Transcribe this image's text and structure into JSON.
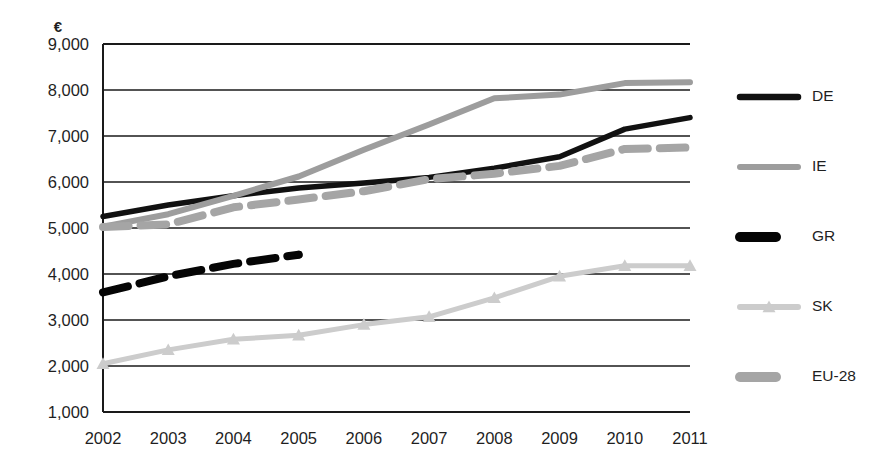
{
  "chart_data": {
    "type": "line",
    "title": "",
    "subtitle": "",
    "xlabel": "",
    "ylabel": "",
    "y_unit_symbol": "€",
    "categories": [
      "2002",
      "2003",
      "2004",
      "2005",
      "2006",
      "2007",
      "2008",
      "2009",
      "2010",
      "2011"
    ],
    "x": [
      2002,
      2003,
      2004,
      2005,
      2006,
      2007,
      2008,
      2009,
      2010,
      2011
    ],
    "xlim": [
      2002,
      2011
    ],
    "ylim": [
      1000,
      9000
    ],
    "y_ticks": [
      1000,
      2000,
      3000,
      4000,
      5000,
      6000,
      7000,
      8000,
      9000
    ],
    "y_tick_labels": [
      "1,000",
      "2,000",
      "3,000",
      "4,000",
      "5,000",
      "6,000",
      "7,000",
      "8,000",
      "9,000"
    ],
    "grid": true,
    "grid_axis": "y",
    "legend_position": "right",
    "series": [
      {
        "name": "DE",
        "color": "#111111",
        "style": "solid",
        "width": 5.5,
        "marker": "none",
        "values": [
          5250,
          5500,
          5700,
          5870,
          5980,
          6100,
          6300,
          6550,
          7150,
          7400
        ]
      },
      {
        "name": "IE",
        "color": "#9d9d9d",
        "style": "solid",
        "width": 6,
        "marker": "none",
        "values": [
          5030,
          5300,
          5700,
          6120,
          6700,
          7250,
          7820,
          7900,
          8150,
          8170
        ]
      },
      {
        "name": "GR",
        "color": "#050505",
        "style": "dashed",
        "width": 8,
        "marker": "none",
        "values": [
          3600,
          3950,
          4220,
          4420,
          null,
          null,
          null,
          null,
          null,
          null
        ]
      },
      {
        "name": "SK",
        "color": "#cccccc",
        "style": "solid",
        "width": 5,
        "marker": "triangle",
        "values": [
          2050,
          2350,
          2580,
          2670,
          2900,
          3070,
          3480,
          3950,
          4180,
          4180
        ]
      },
      {
        "name": "EU-28",
        "color": "#a5a5a5",
        "style": "dashed",
        "width": 8,
        "marker": "none",
        "values": [
          5020,
          5080,
          5450,
          5620,
          5800,
          6060,
          6180,
          6350,
          6720,
          6750
        ]
      }
    ]
  },
  "legend": {
    "items": [
      {
        "label": "DE",
        "color": "#111111",
        "style": "solid",
        "marker": "none"
      },
      {
        "label": "IE",
        "color": "#9d9d9d",
        "style": "solid",
        "marker": "none"
      },
      {
        "label": "GR",
        "color": "#050505",
        "style": "dash-short",
        "marker": "none"
      },
      {
        "label": "SK",
        "color": "#cccccc",
        "style": "solid",
        "marker": "triangle"
      },
      {
        "label": "EU-28",
        "color": "#a5a5a5",
        "style": "dash-short",
        "marker": "none"
      }
    ]
  },
  "axes": {
    "unit_label": "€",
    "frame_color": "#1a1a1a",
    "background": "#ffffff"
  }
}
